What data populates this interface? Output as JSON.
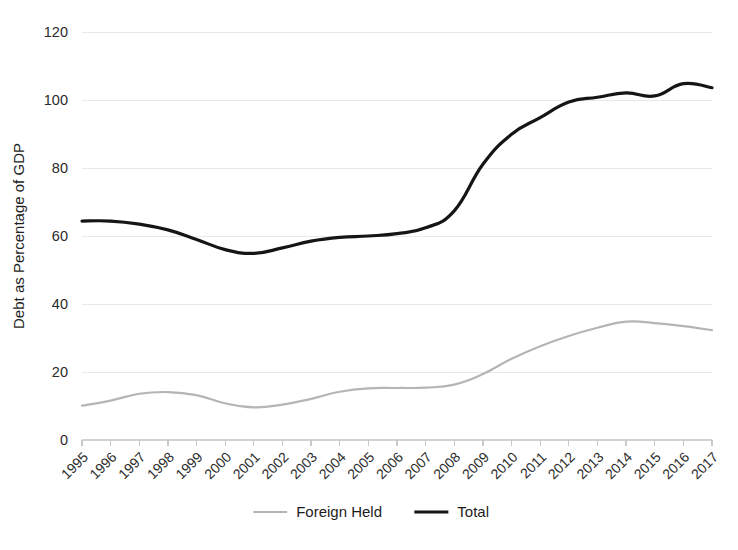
{
  "chart_data": {
    "type": "line",
    "title": "",
    "xlabel": "",
    "ylabel": "Debt as Percentage of GDP",
    "ylim": [
      0,
      120
    ],
    "yticks": [
      0,
      20,
      40,
      60,
      80,
      100,
      120
    ],
    "grid": true,
    "legend_position": "bottom",
    "categories": [
      "1995",
      "1996",
      "1997",
      "1998",
      "1999",
      "2000",
      "2001",
      "2002",
      "2003",
      "2004",
      "2005",
      "2006",
      "2007",
      "2008",
      "2009",
      "2010",
      "2011",
      "2012",
      "2013",
      "2014",
      "2015",
      "2016",
      "2017"
    ],
    "series": [
      {
        "name": "Foreign Held",
        "color": "#b5b5b5",
        "values": [
          10.1,
          11.6,
          13.6,
          14.1,
          13.2,
          10.8,
          9.6,
          10.4,
          12.1,
          14.2,
          15.2,
          15.3,
          15.4,
          16.3,
          19.4,
          23.9,
          27.6,
          30.6,
          33.0,
          34.8,
          34.4,
          33.5,
          32.3
        ]
      },
      {
        "name": "Total",
        "color": "#151515",
        "values": [
          64.4,
          64.4,
          63.5,
          61.8,
          59.0,
          56.0,
          54.9,
          56.5,
          58.5,
          59.6,
          60.0,
          60.7,
          62.4,
          67.4,
          81.1,
          89.9,
          94.8,
          99.4,
          100.8,
          102.1,
          101.2,
          104.8,
          103.6
        ]
      }
    ]
  },
  "legend": {
    "items": [
      {
        "label": "Foreign Held",
        "color": "#b5b5b5",
        "width": 2.2
      },
      {
        "label": "Total",
        "color": "#151515",
        "width": 3.2
      }
    ]
  },
  "axes": {
    "y_title": "Debt as Percentage of GDP",
    "y_tick_labels": [
      "0",
      "20",
      "40",
      "60",
      "80",
      "100",
      "120"
    ],
    "x_tick_labels": [
      "1995",
      "1996",
      "1997",
      "1998",
      "1999",
      "2000",
      "2001",
      "2002",
      "2003",
      "2004",
      "2005",
      "2006",
      "2007",
      "2008",
      "2009",
      "2010",
      "2011",
      "2012",
      "2013",
      "2014",
      "2015",
      "2016",
      "2017"
    ]
  }
}
